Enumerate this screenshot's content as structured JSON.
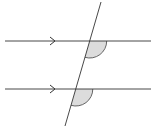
{
  "diagram": {
    "colors": {
      "background": "#ffffff",
      "line": "#333333",
      "angle_fill": "#dcdcdc",
      "angle_stroke": "#555555"
    },
    "parallel_lines": [
      {
        "id": "upper",
        "y": 41,
        "x1": 5,
        "x2": 151,
        "arrow_x": 55
      },
      {
        "id": "lower",
        "y": 89,
        "x1": 5,
        "x2": 151,
        "arrow_x": 55
      }
    ],
    "transversal": {
      "x1": 101,
      "y1": 2,
      "x2": 65,
      "y2": 126
    },
    "angles": [
      {
        "id": "upper-angle",
        "cx": 89.7,
        "cy": 41,
        "r": 17,
        "shaded": true
      },
      {
        "id": "lower-angle",
        "cx": 75.8,
        "cy": 89,
        "r": 17,
        "shaded": true
      }
    ]
  }
}
